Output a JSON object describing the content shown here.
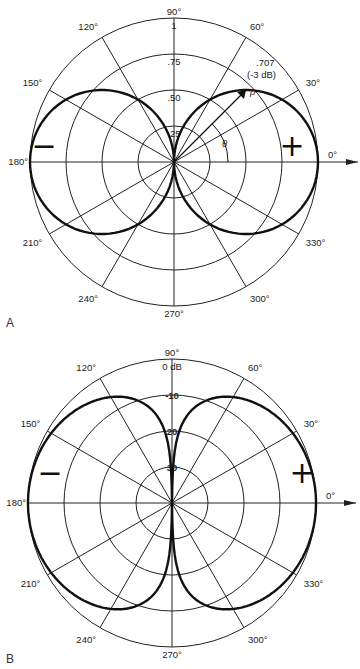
{
  "figure": {
    "panels": [
      {
        "label": "A",
        "subtitle": "Figure-8 pattern (linear scale)"
      },
      {
        "label": "B",
        "subtitle": "Figure-8 pattern (dB scale)"
      }
    ]
  },
  "chart_data": [
    {
      "type": "polar-line",
      "panel": "A",
      "title": "",
      "angle_labels": [
        "0°",
        "30°",
        "60°",
        "90°",
        "120°",
        "150°",
        "180°",
        "210°",
        "240°",
        "270°",
        "300°",
        "330°"
      ],
      "radial_scale": "linear",
      "radial_ticks": [
        "1",
        ".75",
        ".50",
        ".25"
      ],
      "radial_values": [
        1.0,
        0.75,
        0.5,
        0.25
      ],
      "annotations": [
        ".707",
        "(-3 dB)",
        "ρ",
        "θ",
        "+",
        "−"
      ],
      "series": [
        {
          "name": "figure-8 |cos θ|",
          "theta_deg": [
            0,
            15,
            30,
            45,
            60,
            75,
            90,
            105,
            120,
            135,
            150,
            165,
            180,
            195,
            210,
            225,
            240,
            255,
            270,
            285,
            300,
            315,
            330,
            345,
            360
          ],
          "r": [
            1.0,
            0.966,
            0.866,
            0.707,
            0.5,
            0.259,
            0.0,
            0.259,
            0.5,
            0.707,
            0.866,
            0.966,
            1.0,
            0.966,
            0.866,
            0.707,
            0.5,
            0.259,
            0.0,
            0.259,
            0.5,
            0.707,
            0.866,
            0.966,
            1.0
          ]
        }
      ],
      "grid": true
    },
    {
      "type": "polar-line",
      "panel": "B",
      "title": "",
      "angle_labels": [
        "0°",
        "30°",
        "60°",
        "90°",
        "120°",
        "150°",
        "180°",
        "210°",
        "240°",
        "270°",
        "300°",
        "330°"
      ],
      "radial_scale": "dB",
      "radial_ticks": [
        "0 dB",
        "-10",
        "20",
        "30"
      ],
      "radial_values_db": [
        0,
        -10,
        -20,
        -30
      ],
      "annotations": [
        "+",
        "−"
      ],
      "series": [
        {
          "name": "figure-8 20·log|cos θ| (dB)",
          "theta_deg": [
            0,
            15,
            30,
            45,
            60,
            75,
            80,
            85,
            90
          ],
          "db": [
            0,
            -0.3,
            -1.25,
            -3.0,
            -6.0,
            -11.7,
            -15.2,
            -21.2,
            -40
          ]
        }
      ],
      "grid": true
    }
  ]
}
